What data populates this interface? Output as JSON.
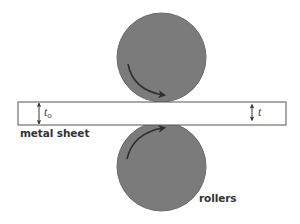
{
  "diagram": {
    "labels": {
      "sheet": "metal sheet",
      "rollers": "rollers",
      "initial_thickness": "t",
      "initial_thickness_subscript": "o",
      "final_thickness": "t"
    },
    "colors": {
      "roller_fill": "#7b7b7b",
      "roller_stroke": "#6a6a6a",
      "arrow": "#2e2e2e",
      "sheet_stroke": "#555555",
      "sheet_fill": "#ffffff",
      "text": "#333333"
    },
    "elements": {
      "top_roller": {
        "cx": 161.5,
        "cy": 57.5,
        "r": 44.5,
        "rotation": "clockwise"
      },
      "bottom_roller": {
        "cx": 161.5,
        "cy": 166.5,
        "r": 44.5,
        "rotation": "counter-clockwise"
      },
      "sheet": {
        "x": 18,
        "y": 102,
        "width": 268,
        "height": 23
      },
      "dimension_t0": {
        "x": 39,
        "y1": 102,
        "y2": 125
      },
      "dimension_t": {
        "x": 252,
        "y1": 104,
        "y2": 121
      }
    }
  }
}
